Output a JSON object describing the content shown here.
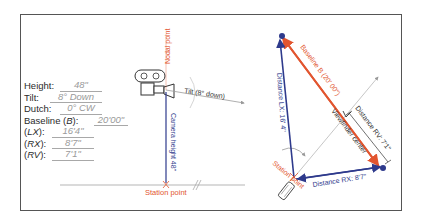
{
  "form": {
    "height_label": "Height:",
    "height_value": "48\"",
    "tilt_label": "Tilt:",
    "tilt_value": "8° Down",
    "dutch_label": "Dutch:",
    "dutch_value": "0° CW",
    "baseline_label_pre": "Baseline (",
    "baseline_label_var": "B",
    "baseline_label_post": "):",
    "baseline_value": "20'00\"",
    "lx_label_var": "LX",
    "lx_value": "16'4\"",
    "rx_label_var": "RX",
    "rx_value": "8'7\"",
    "rv_label_var": "RV",
    "rv_value": "7'1\""
  },
  "side_view": {
    "nodal_point_label": "Nodal point",
    "tilt_label": "Tilt (8° down)",
    "camera_height_label": "Camera height 48\"",
    "station_point_label": "Station point"
  },
  "top_view": {
    "baseline_label": "Baseline B (20' 00\")",
    "distance_lx_label": "Distance LX: 16' 4\"",
    "distance_rx_label": "Distance RX: 8'7\"",
    "distance_rv_label": "Distance RV: 7'1\"",
    "viewfinder_center_label": "Viewfinder center",
    "station_point_label": "Station point"
  },
  "colors": {
    "red": "#e2552f",
    "blue": "#2e3a8c",
    "gray": "#9a9a9a",
    "frame": "#555555"
  }
}
